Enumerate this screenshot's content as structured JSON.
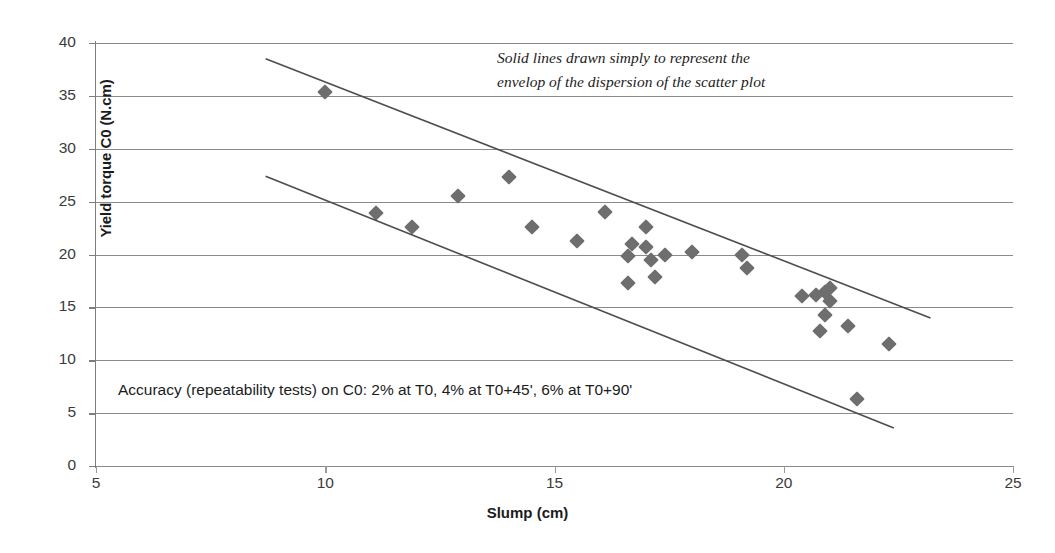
{
  "chart_data": {
    "type": "scatter",
    "title": "",
    "xlabel": "Slump (cm)",
    "ylabel": "Yield torque C0 (N.cm)",
    "xlim": [
      5,
      25
    ],
    "ylim": [
      0,
      40
    ],
    "xticks": [
      5,
      10,
      15,
      20,
      25
    ],
    "yticks": [
      0,
      5,
      10,
      15,
      20,
      25,
      30,
      35,
      40
    ],
    "grid": "horizontal",
    "legend": "none",
    "marker_shape": "diamond",
    "marker_color": "#6e6e6e",
    "series": [
      {
        "name": "Yield torque C0 vs Slump",
        "points": [
          [
            10.0,
            35.4
          ],
          [
            11.1,
            23.9
          ],
          [
            11.9,
            22.6
          ],
          [
            12.9,
            25.5
          ],
          [
            14.0,
            27.3
          ],
          [
            14.5,
            22.6
          ],
          [
            15.5,
            21.3
          ],
          [
            16.1,
            24.0
          ],
          [
            16.6,
            19.9
          ],
          [
            16.7,
            21.0
          ],
          [
            16.6,
            17.3
          ],
          [
            17.0,
            22.6
          ],
          [
            17.0,
            20.7
          ],
          [
            17.1,
            19.5
          ],
          [
            17.2,
            17.9
          ],
          [
            17.4,
            20.0
          ],
          [
            18.0,
            20.2
          ],
          [
            19.1,
            20.0
          ],
          [
            19.2,
            18.7
          ],
          [
            20.4,
            16.1
          ],
          [
            20.7,
            16.2
          ],
          [
            20.9,
            16.5
          ],
          [
            21.0,
            16.8
          ],
          [
            21.0,
            15.6
          ],
          [
            20.9,
            14.3
          ],
          [
            20.8,
            12.8
          ],
          [
            21.4,
            13.2
          ],
          [
            21.6,
            6.3
          ],
          [
            22.3,
            11.5
          ]
        ]
      }
    ],
    "envelope_lines": [
      {
        "name": "upper-envelope",
        "from": [
          8.7,
          38.5
        ],
        "to": [
          23.2,
          14.0
        ],
        "color": "#4d4d4d"
      },
      {
        "name": "lower-envelope",
        "from": [
          8.7,
          27.4
        ],
        "to": [
          22.4,
          3.6
        ],
        "color": "#4d4d4d"
      }
    ],
    "annotations": [
      {
        "name": "envelope-note",
        "lines": [
          "Solid lines drawn simply to represent the",
          "envelop of the dispersion of the scatter plot"
        ],
        "style": "italic",
        "position": "top-right"
      },
      {
        "name": "accuracy-note",
        "text": "Accuracy (repeatability tests) on C0: 2% at T0, 4% at T0+45', 6% at T0+90'",
        "style": "normal",
        "position": "bottom-left"
      }
    ]
  },
  "axes": {
    "x": {
      "label": "Slump (cm)",
      "tick_labels": [
        "5",
        "10",
        "15",
        "20",
        "25"
      ]
    },
    "y": {
      "label": "Yield torque C0 (N.cm)",
      "tick_labels": [
        "0",
        "5",
        "10",
        "15",
        "20",
        "25",
        "30",
        "35",
        "40"
      ]
    }
  },
  "notes": {
    "top_line_1": "Solid lines drawn simply to represent the",
    "top_line_2": "envelop of the dispersion of the scatter plot",
    "bottom": "Accuracy (repeatability tests) on C0: 2% at T0, 4% at T0+45', 6% at T0+90'"
  }
}
